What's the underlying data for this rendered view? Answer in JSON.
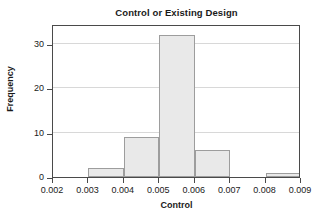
{
  "chart_data": {
    "type": "bar",
    "title": "Control or Existing Design",
    "xlabel": "Control",
    "ylabel": "Frequency",
    "subtype": "histogram",
    "bin_width": 0.001,
    "bin_edges": [
      0.002,
      0.003,
      0.004,
      0.005,
      0.006,
      0.007,
      0.008,
      0.009
    ],
    "categories": [
      "0.002-0.003",
      "0.003-0.004",
      "0.004-0.005",
      "0.005-0.006",
      "0.006-0.007",
      "0.007-0.008",
      "0.008-0.009"
    ],
    "values": [
      0,
      2,
      9,
      32,
      6,
      0,
      1
    ],
    "bars": [
      {
        "label": "0.002-0.003",
        "x0": 0.002,
        "x1": 0.003,
        "value": 0
      },
      {
        "label": "0.003-0.004",
        "x0": 0.003,
        "x1": 0.004,
        "value": 2
      },
      {
        "label": "0.004-0.005",
        "x0": 0.004,
        "x1": 0.005,
        "value": 9
      },
      {
        "label": "0.005-0.006",
        "x0": 0.005,
        "x1": 0.006,
        "value": 32
      },
      {
        "label": "0.006-0.007",
        "x0": 0.006,
        "x1": 0.007,
        "value": 6
      },
      {
        "label": "0.007-0.008",
        "x0": 0.007,
        "x1": 0.008,
        "value": 0
      },
      {
        "label": "0.008-0.009",
        "x0": 0.008,
        "x1": 0.009,
        "value": 1
      }
    ],
    "xlim": [
      0.002,
      0.009
    ],
    "ylim": [
      0,
      34.5
    ],
    "xticks": [
      0.002,
      0.003,
      0.004,
      0.005,
      0.006,
      0.007,
      0.008,
      0.009
    ],
    "xticklabels": [
      "0.002",
      "0.003",
      "0.004",
      "0.005",
      "0.006",
      "0.007",
      "0.008",
      "0.009"
    ],
    "yticks": [
      0,
      10,
      20,
      30
    ],
    "yticklabels": [
      "0",
      "10",
      "20",
      "30"
    ],
    "gridlines_y": [
      10,
      20,
      30
    ],
    "grid": "horizontal",
    "legend": null,
    "colors": {
      "bar_fill": "#e9e9e9",
      "bar_edge": "#9d9d9d",
      "axis": "#4a4a4a",
      "grid": "#d8d8d8",
      "text": "#1a1a1a",
      "background": "#ffffff"
    }
  }
}
